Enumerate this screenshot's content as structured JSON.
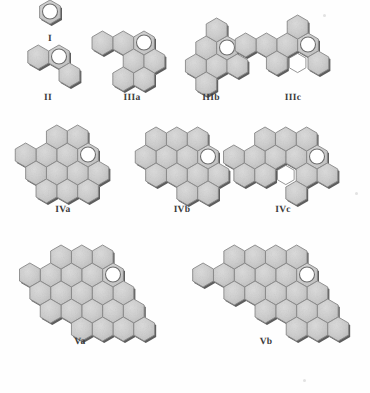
{
  "figure": {
    "background_color": "#fefefe",
    "hex_fill_color": "#c9c9c9",
    "hex_fill_light": "#d6d6d6",
    "hex_edge_color": "#8a8a8a",
    "hex_shadow_color": "#5d5d5d",
    "marker_fill_color": "#ffffff",
    "marker_edge_color": "#6e6e6e",
    "vacancy_fill_color": "#ffffff",
    "label_color": "#3b3b3b",
    "hex_radius_px": 12.0,
    "marker_radius_px": 7.5
  },
  "clusters": [
    {
      "id": "I",
      "label": "I",
      "label_x": 50,
      "label_y": 34,
      "origin_x": 50,
      "origin_y": 12,
      "hex_count": 1,
      "cells": [
        [
          0,
          0
        ]
      ],
      "marker_cell": [
        0,
        0
      ],
      "vacancies": []
    },
    {
      "id": "II",
      "label": "II",
      "label_x": 48,
      "label_y": 93,
      "origin_x": 59,
      "origin_y": 57,
      "hex_count": 3,
      "cells": [
        [
          0,
          0
        ],
        [
          -1,
          0
        ],
        [
          0,
          1
        ]
      ],
      "marker_cell": [
        0,
        0
      ],
      "vacancies": []
    },
    {
      "id": "IIIa",
      "label": "IIIa",
      "label_x": 132,
      "label_y": 93,
      "origin_x": 144,
      "origin_y": 43,
      "hex_count": 7,
      "cells": [
        [
          0,
          0
        ],
        [
          -1,
          0
        ],
        [
          -2,
          0
        ],
        [
          -1,
          1
        ],
        [
          0,
          1
        ],
        [
          -1,
          2
        ],
        [
          0,
          2
        ]
      ],
      "marker_cell": [
        0,
        0
      ],
      "vacancies": []
    },
    {
      "id": "IIIb",
      "label": "IIIb",
      "label_x": 211,
      "label_y": 93,
      "origin_x": 227,
      "origin_y": 48,
      "hex_count": 7,
      "cells": [
        [
          0,
          0
        ],
        [
          -1,
          0
        ],
        [
          -1,
          -1
        ],
        [
          -1,
          1
        ],
        [
          0,
          1
        ],
        [
          -2,
          1
        ],
        [
          -1,
          2
        ]
      ],
      "marker_cell": [
        0,
        0
      ],
      "vacancies": []
    },
    {
      "id": "IIIc",
      "label": "IIIc",
      "label_x": 293,
      "label_y": 93,
      "origin_x": 308,
      "origin_y": 45,
      "hex_count": 7,
      "cells": [
        [
          0,
          0
        ],
        [
          -1,
          0
        ],
        [
          -2,
          0
        ],
        [
          -3,
          0
        ],
        [
          -1,
          -1
        ],
        [
          0,
          1
        ],
        [
          -2,
          1
        ]
      ],
      "marker_cell": [
        0,
        0
      ],
      "vacancies": [
        [
          -1,
          1
        ]
      ]
    },
    {
      "id": "IVa",
      "label": "IVa",
      "label_x": 63,
      "label_y": 205,
      "origin_x": 88,
      "origin_y": 155,
      "hex_count": 13,
      "cells": [
        [
          0,
          0
        ],
        [
          -1,
          0
        ],
        [
          -2,
          0
        ],
        [
          -3,
          0
        ],
        [
          -1,
          -1
        ],
        [
          -2,
          -1
        ],
        [
          0,
          1
        ],
        [
          -1,
          1
        ],
        [
          -2,
          1
        ],
        [
          -3,
          1
        ],
        [
          0,
          2
        ],
        [
          -1,
          2
        ],
        [
          -2,
          2
        ]
      ],
      "marker_cell": [
        0,
        0
      ],
      "vacancies": []
    },
    {
      "id": "IVb",
      "label": "IVb",
      "label_x": 182,
      "label_y": 205,
      "origin_x": 208,
      "origin_y": 157,
      "hex_count": 13,
      "cells": [
        [
          0,
          0
        ],
        [
          -1,
          0
        ],
        [
          -2,
          0
        ],
        [
          -3,
          0
        ],
        [
          -1,
          -1
        ],
        [
          -2,
          -1
        ],
        [
          -3,
          -1
        ],
        [
          0,
          1
        ],
        [
          -1,
          1
        ],
        [
          -2,
          1
        ],
        [
          -3,
          1
        ],
        [
          0,
          2
        ],
        [
          -1,
          2
        ]
      ],
      "marker_cell": [
        0,
        0
      ],
      "vacancies": []
    },
    {
      "id": "IVc",
      "label": "IVc",
      "label_x": 283,
      "label_y": 205,
      "origin_x": 317,
      "origin_y": 157,
      "hex_count": 13,
      "cells": [
        [
          0,
          0
        ],
        [
          -1,
          0
        ],
        [
          -2,
          0
        ],
        [
          -3,
          0
        ],
        [
          -4,
          0
        ],
        [
          -1,
          -1
        ],
        [
          -2,
          -1
        ],
        [
          -3,
          -1
        ],
        [
          0,
          1
        ],
        [
          -1,
          1
        ],
        [
          -3,
          1
        ],
        [
          -4,
          1
        ],
        [
          -1,
          2
        ]
      ],
      "marker_cell": [
        0,
        0
      ],
      "vacancies": [
        [
          -2,
          1
        ]
      ]
    },
    {
      "id": "Va",
      "label": "Va",
      "label_x": 80,
      "label_y": 337,
      "origin_x": 113,
      "origin_y": 275,
      "hex_count": 22,
      "cells": [
        [
          0,
          0
        ],
        [
          -1,
          0
        ],
        [
          -2,
          0
        ],
        [
          -3,
          0
        ],
        [
          -4,
          0
        ],
        [
          -1,
          -1
        ],
        [
          -2,
          -1
        ],
        [
          -3,
          -1
        ],
        [
          0,
          1
        ],
        [
          -1,
          1
        ],
        [
          -2,
          1
        ],
        [
          -3,
          1
        ],
        [
          -4,
          1
        ],
        [
          0,
          2
        ],
        [
          -1,
          2
        ],
        [
          -2,
          2
        ],
        [
          -3,
          2
        ],
        [
          1,
          2
        ],
        [
          0,
          3
        ],
        [
          -1,
          3
        ],
        [
          -2,
          3
        ],
        [
          1,
          3
        ]
      ],
      "marker_cell": [
        0,
        0
      ],
      "vacancies": []
    },
    {
      "id": "Vb",
      "label": "Vb",
      "label_x": 266,
      "label_y": 337,
      "origin_x": 307,
      "origin_y": 275,
      "hex_count": 22,
      "cells": [
        [
          0,
          0
        ],
        [
          -1,
          0
        ],
        [
          -2,
          0
        ],
        [
          -3,
          0
        ],
        [
          -4,
          0
        ],
        [
          -5,
          0
        ],
        [
          -1,
          -1
        ],
        [
          -2,
          -1
        ],
        [
          -3,
          -1
        ],
        [
          -4,
          -1
        ],
        [
          0,
          1
        ],
        [
          -1,
          1
        ],
        [
          -2,
          1
        ],
        [
          -3,
          1
        ],
        [
          -4,
          1
        ],
        [
          0,
          2
        ],
        [
          -1,
          2
        ],
        [
          -2,
          2
        ],
        [
          1,
          2
        ],
        [
          0,
          3
        ],
        [
          -1,
          3
        ],
        [
          1,
          3
        ]
      ],
      "marker_cell": [
        0,
        0
      ],
      "vacancies": []
    }
  ],
  "specks": [
    {
      "x": 323,
      "y": 14,
      "size": 3
    },
    {
      "x": 355,
      "y": 192,
      "size": 3
    },
    {
      "x": 303,
      "y": 379,
      "size": 3
    }
  ]
}
